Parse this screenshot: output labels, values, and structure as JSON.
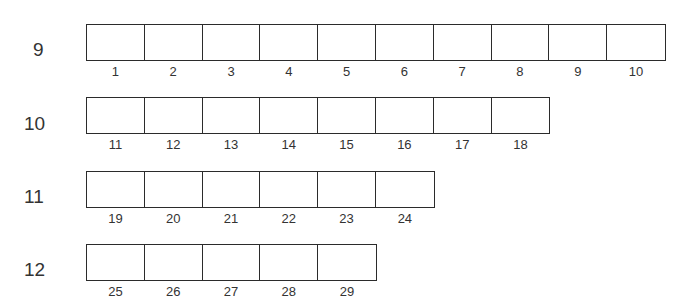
{
  "rows": [
    {
      "label": "9",
      "cells": [
        "1",
        "2",
        "3",
        "4",
        "5",
        "6",
        "7",
        "8",
        "9",
        "10"
      ]
    },
    {
      "label": "10",
      "cells": [
        "11",
        "12",
        "13",
        "14",
        "15",
        "16",
        "17",
        "18"
      ]
    },
    {
      "label": "11",
      "cells": [
        "19",
        "20",
        "21",
        "22",
        "23",
        "24"
      ]
    },
    {
      "label": "12",
      "cells": [
        "25",
        "26",
        "27",
        "28",
        "29"
      ]
    }
  ],
  "colors": {
    "line": "#2b2b2b",
    "text": "#333333",
    "background": "#ffffff"
  }
}
